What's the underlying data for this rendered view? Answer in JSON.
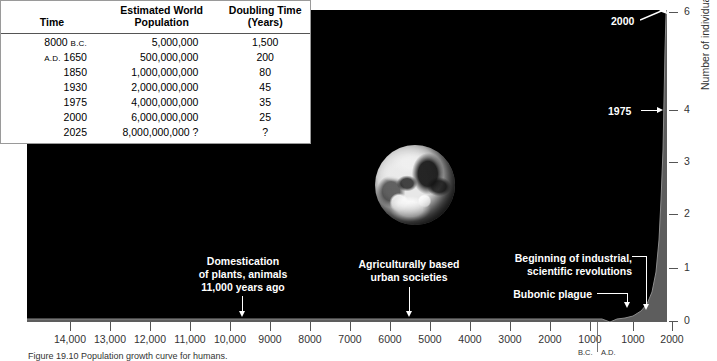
{
  "figure": {
    "caption": "Figure  19.10  Population growth curve for humans.",
    "earth_alt": "earth-photograph"
  },
  "table": {
    "headers": [
      "Time",
      "Estimated World Population",
      "Doubling Time (Years)"
    ],
    "header_lines": {
      "time": "Time",
      "pop_l1": "Estimated World",
      "pop_l2": "Population",
      "dbl_l1": "Doubling Time",
      "dbl_l2": "(Years)"
    },
    "rows": [
      {
        "time_num": "8000",
        "time_era": "B.C.",
        "era_first": false,
        "population": "5,000,000",
        "doubling": "1,500"
      },
      {
        "time_num": "1650",
        "time_era": "A.D.",
        "era_first": true,
        "population": "500,000,000",
        "doubling": "200"
      },
      {
        "time_num": "1850",
        "time_era": "",
        "era_first": false,
        "population": "1,000,000,000",
        "doubling": "80"
      },
      {
        "time_num": "1930",
        "time_era": "",
        "era_first": false,
        "population": "2,000,000,000",
        "doubling": "45"
      },
      {
        "time_num": "1975",
        "time_era": "",
        "era_first": false,
        "population": "4,000,000,000",
        "doubling": "35"
      },
      {
        "time_num": "2000",
        "time_era": "",
        "era_first": false,
        "population": "6,000,000,000",
        "doubling": "25"
      },
      {
        "time_num": "2025",
        "time_era": "",
        "era_first": false,
        "population": "8,000,000,000 ?",
        "doubling": "?"
      }
    ]
  },
  "chart_data": {
    "type": "area",
    "title": "Population growth curve for humans",
    "xlabel": "",
    "ylabel": "Number of individuals (billions)",
    "ylim": [
      0,
      6
    ],
    "yticks": [
      0,
      1,
      2,
      3,
      4,
      6
    ],
    "ytick_labels": [
      "0",
      "1",
      "2",
      "3",
      "4",
      "6"
    ],
    "grid": false,
    "legend": "none",
    "x_axis_note": "Years before present / after; B.C. to the left of the divider, A.D. to the right",
    "xtick_labels": [
      "14,000",
      "13,000",
      "12,000",
      "11,000",
      "10,000",
      "9000",
      "8000",
      "7000",
      "6000",
      "5000",
      "4000",
      "3000",
      "2000",
      "1000",
      "1000",
      "2000"
    ],
    "xtick_eras": [
      "B.C.",
      "A.D."
    ],
    "x": [
      -14000,
      -12000,
      -10000,
      -9000,
      -8000,
      -6000,
      -4000,
      -3000,
      -2000,
      -1000,
      0,
      500,
      1000,
      1340,
      1400,
      1650,
      1800,
      1850,
      1900,
      1930,
      1950,
      1975,
      2000
    ],
    "values": [
      0.004,
      0.005,
      0.005,
      0.005,
      0.006,
      0.01,
      0.03,
      0.05,
      0.1,
      0.15,
      0.2,
      0.21,
      0.26,
      0.4,
      0.35,
      0.5,
      0.9,
      1.0,
      1.6,
      2.0,
      2.5,
      4.0,
      6.0
    ],
    "annotations": [
      {
        "name": "domestication",
        "lines": [
          "Domestication",
          "of plants, animals",
          "11,000 years ago"
        ],
        "points_to_x": "9000 B.C."
      },
      {
        "name": "urban-societies",
        "lines": [
          "Agriculturally based",
          "urban societies"
        ],
        "points_to_x": "5000 B.C."
      },
      {
        "name": "industrial-revolution",
        "lines": [
          "Beginning of industrial,",
          "scientific revolutions"
        ],
        "points_to_x": "A.D. 1600s"
      },
      {
        "name": "bubonic-plague",
        "lines": [
          "Bubonic plague"
        ],
        "points_to_x": "A.D. 1350"
      },
      {
        "name": "year-1975",
        "lines": [
          "1975"
        ],
        "points_to_y": "4"
      },
      {
        "name": "year-2000",
        "lines": [
          "2000"
        ],
        "points_to_y": "6"
      }
    ]
  }
}
